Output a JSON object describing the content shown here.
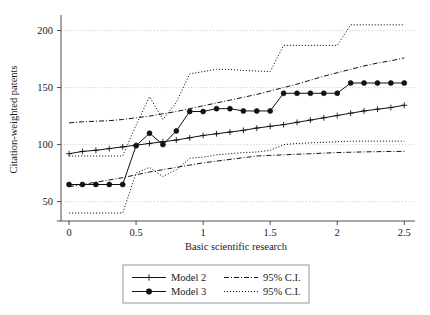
{
  "figure": {
    "width": 430,
    "height": 315,
    "background": "#ffffff",
    "ink_color": "#111111",
    "grid_color": "#b9b9b9"
  },
  "axes": {
    "x_title": "Basic scientific research",
    "y_title": "Citation-weighted patents",
    "x_ticks": [
      "0",
      "0.5",
      "1",
      "1.5",
      "2",
      "2.5"
    ],
    "x_tick_values": [
      0,
      0.5,
      1,
      1.5,
      2,
      2.5
    ],
    "y_ticks": [
      "50",
      "100",
      "150",
      "200"
    ],
    "y_tick_values": [
      50,
      100,
      150,
      200
    ]
  },
  "legend": {
    "entries": [
      {
        "label": "Model 2",
        "style": "solid-plus"
      },
      {
        "label": "95% C.I.",
        "style": "dashdot"
      },
      {
        "label": "Model 3",
        "style": "solid-dot"
      },
      {
        "label": "95% C.I.",
        "style": "dotted"
      }
    ]
  },
  "chart_data": {
    "type": "line",
    "title": "",
    "subtitle": "",
    "xlabel": "Basic scientific research",
    "ylabel": "Citation-weighted patents",
    "xlim": [
      -0.06,
      2.58
    ],
    "ylim": [
      33,
      211
    ],
    "xticks": [
      0,
      0.5,
      1,
      1.5,
      2,
      2.5
    ],
    "yticks": [
      50,
      100,
      150,
      200
    ],
    "grid": "horizontal-dotted",
    "legend_position": "below-center",
    "x": [
      0,
      0.1,
      0.2,
      0.3,
      0.4,
      0.5,
      0.6,
      0.7,
      0.8,
      0.9,
      1.0,
      1.1,
      1.2,
      1.3,
      1.4,
      1.5,
      1.6,
      1.7,
      1.8,
      1.9,
      2.0,
      2.1,
      2.2,
      2.3,
      2.4,
      2.5
    ],
    "series": [
      {
        "name": "Model 2",
        "style": "solid",
        "marker": "plus",
        "values": [
          92,
          94,
          95,
          96.5,
          98,
          99.5,
          101,
          102.5,
          104,
          106,
          108,
          109.5,
          111,
          112.5,
          114.5,
          116,
          117.5,
          119.5,
          121.5,
          123.5,
          125.5,
          127.5,
          129.5,
          131,
          132.5,
          134.5
        ]
      },
      {
        "name": "Model 3",
        "style": "solid",
        "marker": "circle",
        "values": [
          65,
          65,
          65,
          65,
          65,
          99,
          110,
          100,
          112,
          129,
          129,
          131.5,
          131.5,
          129.5,
          129.5,
          129.5,
          145,
          145,
          145,
          145,
          145,
          154,
          154,
          154,
          154,
          154
        ]
      },
      {
        "name": "95% C.I. upper (Model 2)",
        "style": "dashdot",
        "marker": "none",
        "values": [
          119,
          120,
          120.5,
          121,
          122,
          123.5,
          125,
          127,
          129,
          131.5,
          134,
          136.5,
          139,
          141.5,
          144,
          147,
          150,
          153,
          156.5,
          160,
          163,
          166,
          169,
          171.5,
          173.5,
          176
        ]
      },
      {
        "name": "95% C.I. lower (Model 2)",
        "style": "dashdot",
        "marker": "none",
        "values": [
          63,
          65,
          67,
          69,
          71,
          73.5,
          76,
          78,
          80,
          82,
          84,
          85.5,
          87,
          88.5,
          90,
          90.5,
          91,
          91.5,
          92,
          92.5,
          93,
          93.3,
          93.6,
          93.8,
          94,
          94
        ]
      },
      {
        "name": "95% C.I. upper (Model 3)",
        "style": "dotted",
        "marker": "none",
        "values": [
          90,
          90,
          90,
          90,
          90,
          117,
          142,
          122,
          137,
          162,
          164,
          166,
          166,
          165,
          164.5,
          164,
          187,
          187,
          187,
          187,
          187,
          205,
          205,
          205,
          205,
          205
        ]
      },
      {
        "name": "95% C.I. lower (Model 3)",
        "style": "dotted",
        "marker": "none",
        "values": [
          40,
          40,
          40,
          40,
          40,
          75,
          80,
          72,
          78,
          88,
          89,
          91,
          92,
          93,
          93.5,
          95,
          100,
          101,
          101.5,
          102,
          102.5,
          103,
          103,
          103,
          103,
          103
        ]
      }
    ]
  }
}
